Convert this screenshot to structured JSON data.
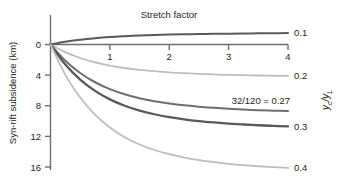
{
  "chart_data": {
    "type": "line",
    "title": "Stretch factor",
    "xlabel": "Stretch factor",
    "ylabel": "Syn-rift subsidence (km)",
    "right_axis_label": "yc/yL",
    "right_axis_label_main": "y",
    "right_axis_label_sub1": "c",
    "right_axis_label_slash": "/y",
    "right_axis_label_sub2": "L",
    "xlim": [
      0,
      4
    ],
    "ylim": [
      -2,
      17
    ],
    "y_inverted": true,
    "grid": false,
    "legend_position": "right-of-curve-ends",
    "x_ticks": [
      1,
      2,
      3,
      4
    ],
    "x_tick_labels": [
      "1",
      "2",
      "3",
      "4"
    ],
    "y_ticks": [
      0,
      4,
      8,
      12,
      16
    ],
    "y_tick_labels": [
      "0",
      "4",
      "8",
      "12",
      "16"
    ],
    "x": [
      0,
      0.25,
      0.5,
      0.75,
      1,
      1.25,
      1.5,
      1.75,
      2,
      2.25,
      2.5,
      2.75,
      3,
      3.25,
      3.5,
      3.75,
      4
    ],
    "series": [
      {
        "name": "0.1",
        "label": "0.1",
        "color": "#595a5c",
        "width": 2.0,
        "values": [
          0,
          -0.36,
          -0.62,
          -0.82,
          -0.97,
          -1.08,
          -1.17,
          -1.24,
          -1.29,
          -1.33,
          -1.37,
          -1.4,
          -1.42,
          -1.44,
          -1.46,
          -1.47,
          -1.49
        ]
      },
      {
        "name": "0.2",
        "label": "0.2",
        "color": "#bcbdc0",
        "width": 1.8,
        "values": [
          0,
          1.0,
          1.76,
          2.33,
          2.75,
          3.07,
          3.31,
          3.49,
          3.64,
          3.75,
          3.84,
          3.91,
          3.97,
          4.01,
          4.05,
          4.08,
          4.11
        ]
      },
      {
        "name": "0.27",
        "label": "32/120 = 0.27",
        "color": "#6d6e71",
        "width": 2.0,
        "values": [
          0,
          2.13,
          3.72,
          4.93,
          5.83,
          6.5,
          7.01,
          7.4,
          7.7,
          7.94,
          8.12,
          8.27,
          8.4,
          8.5,
          8.58,
          8.64,
          8.7
        ]
      },
      {
        "name": "0.3",
        "label": "0.3",
        "color": "#58595b",
        "width": 2.3,
        "values": [
          0,
          2.62,
          4.58,
          6.06,
          7.17,
          8.0,
          8.63,
          9.11,
          9.48,
          9.77,
          10.0,
          10.18,
          10.33,
          10.45,
          10.55,
          10.63,
          10.7
        ]
      },
      {
        "name": "0.4",
        "label": "0.4",
        "color": "#bcbdc0",
        "width": 1.8,
        "values": [
          0,
          3.96,
          6.93,
          9.17,
          10.85,
          12.11,
          13.06,
          13.78,
          14.33,
          14.76,
          15.1,
          15.37,
          15.58,
          15.76,
          15.9,
          16.02,
          16.12
        ]
      }
    ],
    "annotations": [
      {
        "text": "32/120 = 0.27",
        "for": "0.27"
      }
    ]
  },
  "axes": {
    "left_title": "Syn-rift subsidence (km)",
    "top_title": "Stretch factor",
    "right_title": "yc/yL"
  },
  "colors": {
    "axis": "#6d6e71",
    "text": "#231f20",
    "light_curve": "#bcbdc0",
    "dark_curve": "#58595b",
    "background": "#ffffff"
  }
}
